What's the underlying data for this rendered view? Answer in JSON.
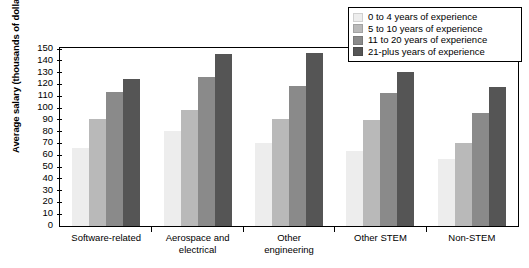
{
  "chart_data": {
    "type": "bar",
    "title": "",
    "subtitle": "",
    "xlabel": "",
    "ylabel": "Average salary (thousands of dollars)",
    "ylim": [
      0,
      150
    ],
    "ytick_step": 10,
    "yticks": [
      150,
      140,
      130,
      120,
      110,
      100,
      90,
      80,
      70,
      60,
      50,
      40,
      30,
      20,
      10,
      0
    ],
    "grid": false,
    "legend_position": "top-right",
    "categories": [
      "Software-related",
      "Aerospace and\nelectrical",
      "Other\nengineering",
      "Other STEM",
      "Non-STEM"
    ],
    "series": [
      {
        "name": "0 to 4 years of experience",
        "color": "#ededed",
        "values": [
          66,
          80,
          70,
          63,
          56
        ]
      },
      {
        "name": "5 to 10 years of experience",
        "color": "#b9b9b9",
        "values": [
          90,
          98,
          90,
          89,
          70
        ]
      },
      {
        "name": "11 to 20 years of experience",
        "color": "#8a8a8a",
        "values": [
          113,
          126,
          118,
          112,
          95
        ]
      },
      {
        "name": "21-plus years of experience",
        "color": "#555555",
        "values": [
          124,
          145,
          146,
          130,
          117
        ]
      }
    ]
  },
  "legend": {
    "items": [
      {
        "label": "0 to 4 years of experience",
        "color": "#ededed"
      },
      {
        "label": "5 to 10 years of experience",
        "color": "#b9b9b9"
      },
      {
        "label": "11 to 20 years of experience",
        "color": "#8a8a8a"
      },
      {
        "label": "21-plus years of experience",
        "color": "#555555"
      }
    ]
  }
}
